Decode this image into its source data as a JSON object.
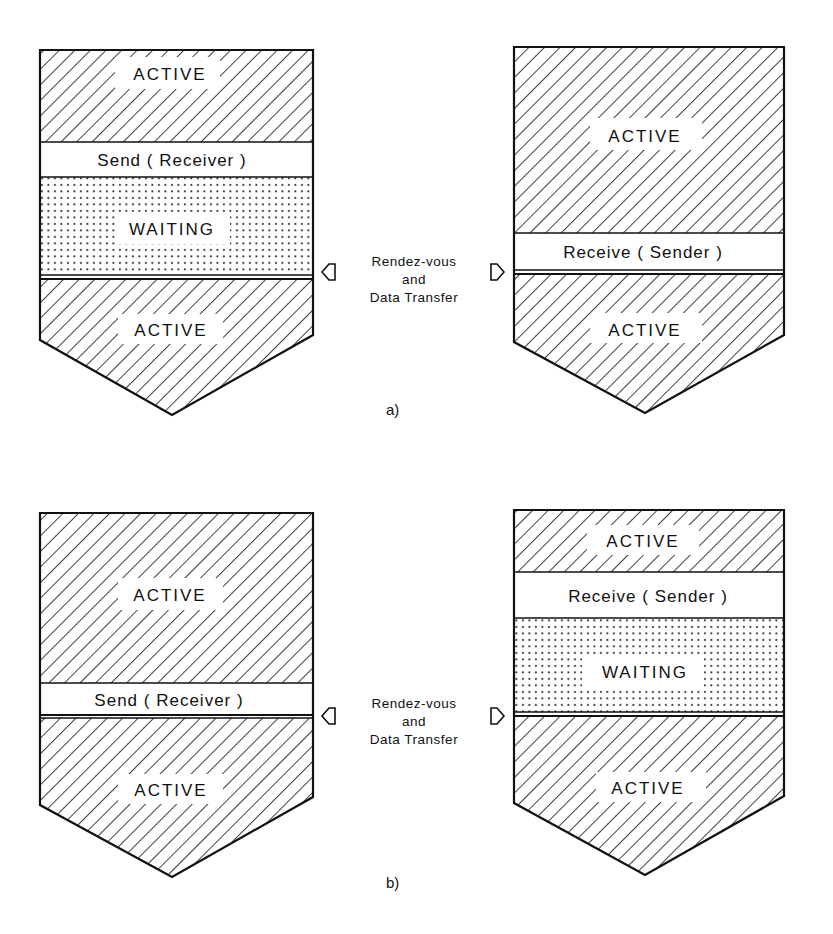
{
  "diagrams": {
    "a": {
      "caption": "a)",
      "left_process": {
        "top_state": "ACTIVE",
        "operation": "Send ( Receiver )",
        "waiting_state": "WAITING",
        "bottom_state": "ACTIVE"
      },
      "right_process": {
        "top_state": "ACTIVE",
        "operation": "Receive ( Sender )",
        "bottom_state": "ACTIVE"
      },
      "connector": {
        "line1": "Rendez-vous",
        "line2": "and",
        "line3": "Data Transfer"
      }
    },
    "b": {
      "caption": "b)",
      "left_process": {
        "top_state": "ACTIVE",
        "operation": "Send ( Receiver )",
        "bottom_state": "ACTIVE"
      },
      "right_process": {
        "top_state": "ACTIVE",
        "operation": "Receive ( Sender )",
        "waiting_state": "WAITING",
        "bottom_state": "ACTIVE"
      },
      "connector": {
        "line1": "Rendez-vous",
        "line2": "and",
        "line3": "Data Transfer"
      }
    }
  },
  "legend_semantics": {
    "hatched": "ACTIVE",
    "dotted": "WAITING",
    "white_band": "communication primitive"
  },
  "colors": {
    "ink": "#111111",
    "background": "#ffffff"
  }
}
